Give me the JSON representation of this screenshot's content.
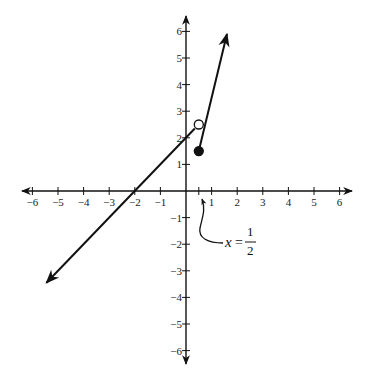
{
  "chart_data": {
    "type": "line",
    "title": "",
    "xlabel": "",
    "ylabel": "",
    "xlim": [
      -6.5,
      6.5
    ],
    "ylim": [
      -6.5,
      6.5
    ],
    "grid": false,
    "x_ticks": [
      -6,
      -5,
      -4,
      -3,
      -2,
      -1,
      1,
      2,
      3,
      4,
      5,
      6
    ],
    "y_ticks": [
      -6,
      -5,
      -4,
      -3,
      -2,
      -1,
      1,
      2,
      3,
      4,
      5,
      6
    ],
    "x_tick_labels": [
      "−6",
      "−5",
      "−4",
      "−3",
      "−2",
      "−1",
      "1",
      "2",
      "3",
      "4",
      "5",
      "6"
    ],
    "y_tick_labels": [
      "−6",
      "−5",
      "−4",
      "−3",
      "−2",
      "−1",
      "1",
      "2",
      "3",
      "4",
      "5",
      "6"
    ],
    "series": [
      {
        "name": "left piece",
        "equation": "y = x + 2",
        "domain": "x < 1/2",
        "points": [
          [
            -5.45,
            -3.45
          ],
          [
            -2,
            0
          ],
          [
            0,
            2
          ],
          [
            0.5,
            2.5
          ]
        ],
        "left_end": "arrow",
        "right_end": "open circle"
      },
      {
        "name": "right piece",
        "equation": "y = 4x - 0.5",
        "domain": "x >= 1/2",
        "points": [
          [
            0.5,
            1.5
          ],
          [
            1.6,
            5.9
          ]
        ],
        "left_end": "closed circle",
        "right_end": "arrow"
      }
    ],
    "markers": [
      {
        "x": 0.5,
        "y": 2.5,
        "style": "open"
      },
      {
        "x": 0.5,
        "y": 1.5,
        "style": "filled"
      }
    ],
    "annotations": [
      {
        "text": "x = 1/2",
        "points_to": [
          0.5,
          0
        ],
        "variable": "x",
        "equals": "=",
        "numerator": "1",
        "denominator": "2"
      }
    ]
  },
  "annotation": {
    "variable": "x",
    "equals": "=",
    "numerator": "1",
    "denominator": "2"
  }
}
